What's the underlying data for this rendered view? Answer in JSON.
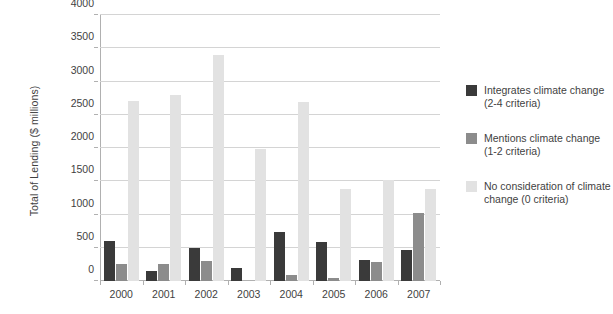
{
  "chart_data": {
    "type": "bar",
    "title": "",
    "xlabel": "",
    "ylabel": "Total of Lending ($ millions)",
    "ylim": [
      0,
      4000
    ],
    "ytick_labels": [
      "4000",
      "3500",
      "3000",
      "2500",
      "2000",
      "1500",
      "1000",
      "500",
      "0"
    ],
    "yticks": [
      4000,
      3500,
      3000,
      2500,
      2000,
      1500,
      1000,
      500,
      0
    ],
    "grid": true,
    "legend_position": "right",
    "categories": [
      "2000",
      "2001",
      "2002",
      "2003",
      "2004",
      "2005",
      "2006",
      "2007"
    ],
    "series": [
      {
        "name": "Integrates climate change (2-4 criteria)",
        "label_line1": "Integrates climate change",
        "label_line2": "(2-4 criteria)",
        "color": "#3a3a3a",
        "values": [
          600,
          150,
          490,
          190,
          740,
          590,
          320,
          470
        ]
      },
      {
        "name": "Mentions climate change (1-2 criteria)",
        "label_line1": "Mentions climate change",
        "label_line2": "(1-2 criteria)",
        "color": "#8c8c8c",
        "values": [
          250,
          260,
          300,
          0,
          90,
          50,
          290,
          1030
        ]
      },
      {
        "name": "No consideration of climate change (0 criteria)",
        "label_line1": "No consideration of climate",
        "label_line2": "change (0 criteria)",
        "color": "#e2e2e2",
        "values": [
          2700,
          2790,
          3400,
          1980,
          2690,
          1380,
          1520,
          1380
        ]
      }
    ]
  }
}
